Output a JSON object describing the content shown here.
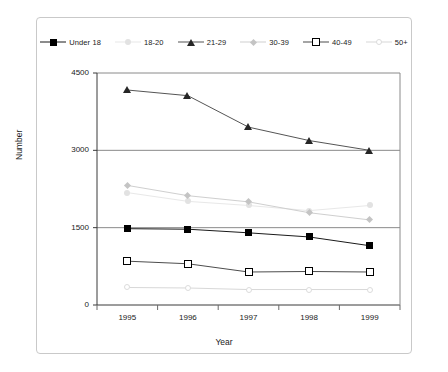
{
  "chart_data": {
    "type": "line",
    "title": "",
    "xlabel": "Year",
    "ylabel": "Number",
    "categories": [
      "1995",
      "1996",
      "1997",
      "1998",
      "1999"
    ],
    "ylim": [
      0,
      4500
    ],
    "yticks": [
      0,
      1500,
      3000,
      4500
    ],
    "ytick_labels": [
      "0",
      "1500",
      "3000",
      "4500"
    ],
    "grid": true,
    "legend_position": "top",
    "series": [
      {
        "name": "Under 18",
        "marker": "filled-square",
        "color": "#000000",
        "line_color": "#1a1a1a",
        "values": [
          1480,
          1470,
          1400,
          1320,
          1150
        ]
      },
      {
        "name": "18-20",
        "marker": "light-circle",
        "color": "#e2e2e2",
        "line_color": "#e8e8e8",
        "values": [
          2180,
          2010,
          1930,
          1830,
          1930
        ]
      },
      {
        "name": "21-29",
        "marker": "filled-triangle",
        "color": "#262626",
        "line_color": "#555555",
        "values": [
          4170,
          4060,
          3450,
          3190,
          3000
        ]
      },
      {
        "name": "30-39",
        "marker": "diamond",
        "color": "#c4c4c4",
        "line_color": "#cfcfcf",
        "values": [
          2320,
          2120,
          2000,
          1790,
          1650
        ]
      },
      {
        "name": "40-49",
        "marker": "open-square",
        "color": "#ffffff",
        "line_color": "#4d4d4d",
        "values": [
          850,
          800,
          640,
          650,
          640
        ]
      },
      {
        "name": "50+",
        "marker": "faint-circle",
        "color": "#dcdcdc",
        "line_color": "#d8d8d8",
        "values": [
          340,
          330,
          300,
          300,
          300
        ]
      }
    ]
  },
  "legend": {
    "items": [
      {
        "label": "Under 18"
      },
      {
        "label": "18-20"
      },
      {
        "label": "21-29"
      },
      {
        "label": "30-39"
      },
      {
        "label": "40-49"
      },
      {
        "label": "50+"
      }
    ]
  },
  "axes": {
    "y_title": "Number",
    "x_title": "Year"
  }
}
